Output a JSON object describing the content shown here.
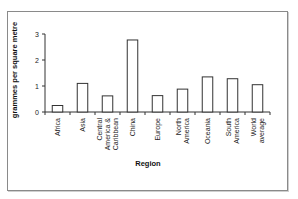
{
  "chart_data": {
    "type": "bar",
    "title": "",
    "xlabel": "Region",
    "ylabel": "grammes per square metre",
    "ylim": [
      0,
      3
    ],
    "yticks": [
      0,
      1,
      2,
      3
    ],
    "grid": false,
    "legend": "none",
    "categories": [
      [
        "Africa"
      ],
      [
        "Asia"
      ],
      [
        "Central",
        "America &",
        "Caribbean"
      ],
      [
        "China"
      ],
      [
        "Europe"
      ],
      [
        "North",
        "America"
      ],
      [
        "Oceania"
      ],
      [
        "South",
        "America"
      ],
      [
        "World",
        "average"
      ]
    ],
    "category_names": [
      "Africa",
      "Asia",
      "Central America & Caribbean",
      "China",
      "Europe",
      "North America",
      "Oceania",
      "South America",
      "World average"
    ],
    "values": [
      0.25,
      1.1,
      0.62,
      2.77,
      0.63,
      0.88,
      1.35,
      1.28,
      1.05
    ],
    "colors": {
      "bar_fill": "#ffffff",
      "bar_stroke": "#333333",
      "axis": "#333333"
    }
  }
}
